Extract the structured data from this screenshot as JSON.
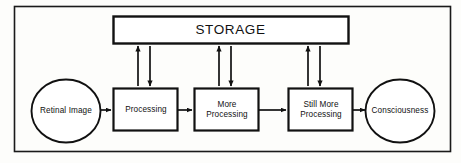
{
  "diagram": {
    "frame": {
      "name": "outer-frame",
      "stroke": "#1a1a1a"
    },
    "colors": {
      "stroke": "#111111",
      "background": "#fdfdfb",
      "text": "#111111"
    },
    "storage": {
      "label": "STORAGE",
      "shape": "rectangle"
    },
    "nodes": [
      {
        "id": "retinal-image",
        "label": "Retinal Image",
        "shape": "ellipse"
      },
      {
        "id": "processing",
        "label": "Processing",
        "shape": "rectangle"
      },
      {
        "id": "more-processing",
        "label": "More\nProcessing",
        "shape": "rectangle"
      },
      {
        "id": "still-more-processing",
        "label": "Still More\nProcessing",
        "shape": "rectangle"
      },
      {
        "id": "consciousness",
        "label": "Consciousness",
        "shape": "ellipse"
      }
    ],
    "flow_arrows": [
      {
        "from": "retinal-image",
        "to": "processing",
        "direction": "right"
      },
      {
        "from": "processing",
        "to": "more-processing",
        "direction": "right"
      },
      {
        "from": "more-processing",
        "to": "still-more-processing",
        "direction": "right"
      },
      {
        "from": "still-more-processing",
        "to": "consciousness",
        "direction": "right"
      }
    ],
    "storage_arrows": [
      {
        "node": "processing",
        "to_storage": "up",
        "from_storage": "down"
      },
      {
        "node": "more-processing",
        "to_storage": "up",
        "from_storage": "down"
      },
      {
        "node": "still-more-processing",
        "to_storage": "up",
        "from_storage": "down"
      }
    ]
  }
}
